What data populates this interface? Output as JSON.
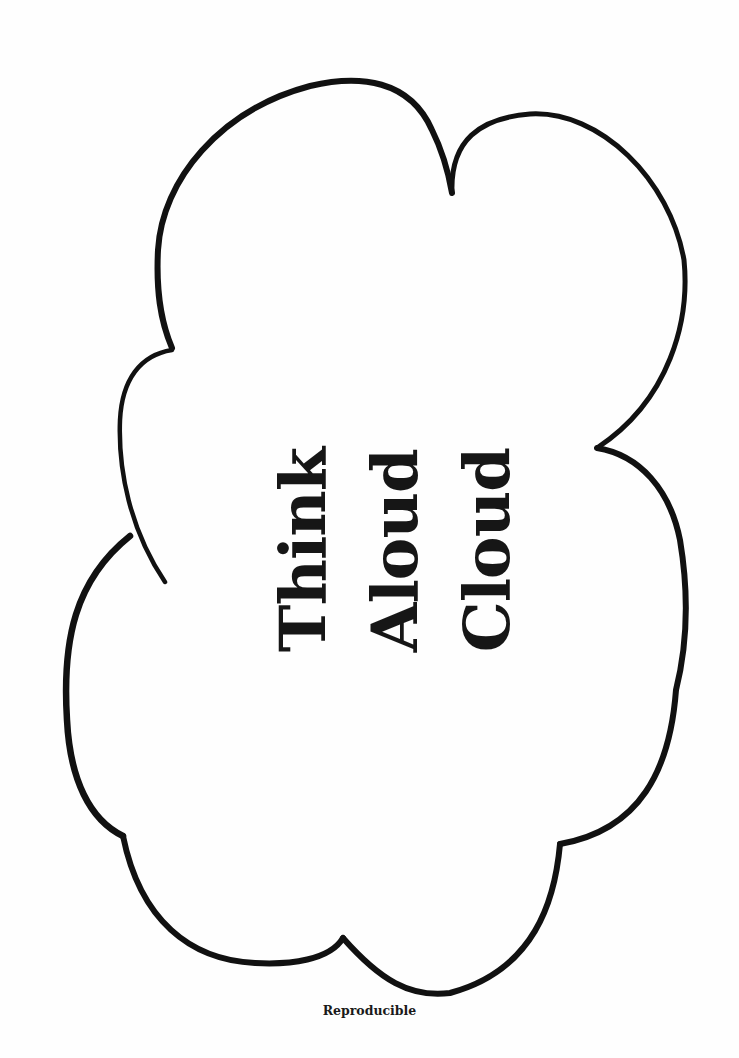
{
  "worksheet": {
    "title_lines": [
      "Think",
      "Aloud",
      "Cloud"
    ],
    "footer": "Reproducible"
  },
  "graphic": {
    "shape": "cloud-outline-icon",
    "stroke_color": "#111111",
    "background_color": "#fefefe"
  }
}
